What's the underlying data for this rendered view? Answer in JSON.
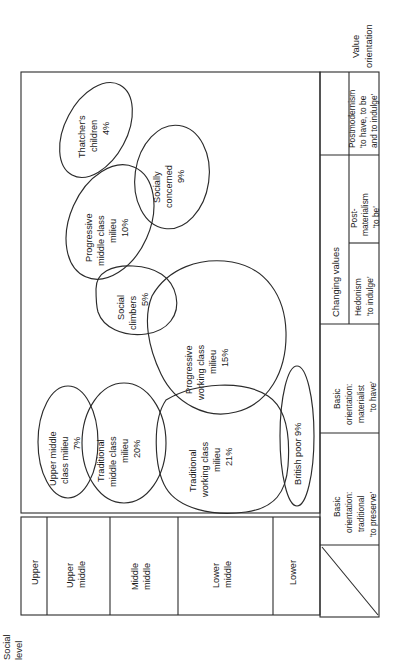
{
  "figure": {
    "axis_labels": {
      "y_axis": "Social level",
      "x_axis": "Value orientation",
      "changing_values_header": "Changing values"
    }
  },
  "social_levels": [
    {
      "id": "upper",
      "label": "Upper"
    },
    {
      "id": "upper-middle",
      "label": "Upper\nmiddle"
    },
    {
      "id": "middle-middle",
      "label": "Middle\nmiddle"
    },
    {
      "id": "lower-middle",
      "label": "Lower\nmiddle"
    },
    {
      "id": "lower",
      "label": "Lower"
    }
  ],
  "value_orientations": [
    {
      "id": "basic-traditional",
      "group": "",
      "line1": "Basic",
      "line2": "orientation:",
      "line3": "traditional",
      "line4": "'to preserve'"
    },
    {
      "id": "basic-materialist",
      "group": "",
      "line1": "Basic",
      "line2": "orientation:",
      "line3": "materialist",
      "line4": "'to have'"
    },
    {
      "id": "hedonism",
      "group": "Changing values",
      "line1": "Hedonism",
      "line2": "'to indulge'",
      "line3": "",
      "line4": ""
    },
    {
      "id": "post-materialism",
      "group": "Changing values",
      "line1": "Post-",
      "line2": "materialism",
      "line3": "'to be'",
      "line4": ""
    },
    {
      "id": "postmodernism",
      "group": "Changing values",
      "line1": "Postmodernism",
      "line2": "'to have, to be",
      "line3": "and to indulge'",
      "line4": ""
    }
  ],
  "milieus": [
    {
      "id": "thatchers-children",
      "name": "Thatcher's\nchildren",
      "share": "4%"
    },
    {
      "id": "progressive-middle-class",
      "name": "Progressive\nmiddle class\nmilieu",
      "share": "10%"
    },
    {
      "id": "socially-concerned",
      "name": "Socially\nconcerned",
      "share": "9%"
    },
    {
      "id": "social-climbers",
      "name": "Social\nclimbers",
      "share": "5%"
    },
    {
      "id": "progressive-working-class",
      "name": "Progressive\nworking class\nmilieu",
      "share": "15%"
    },
    {
      "id": "upper-middle-class",
      "name": "Upper middle\nclass milieu",
      "share": "7%"
    },
    {
      "id": "traditional-middle-class",
      "name": "Traditional\nmiddle class\nmilieu",
      "share": "20%"
    },
    {
      "id": "traditional-working-class",
      "name": "Traditional\nworking class\nmilieu",
      "share": "21%"
    },
    {
      "id": "british-poor",
      "name": "British poor",
      "share": "9%"
    }
  ],
  "milieu_text": {
    "thatchers_children": {
      "l1": "Thatcher's",
      "l2": "children",
      "l3": "4%"
    },
    "progressive_middle": {
      "l1": "Progressive",
      "l2": "middle class",
      "l3": "milieu",
      "l4": "10%"
    },
    "socially_concerned": {
      "l1": "Socially",
      "l2": "concerned",
      "l3": "9%"
    },
    "social_climbers": {
      "l1": "Social",
      "l2": "climbers",
      "l3": "5%"
    },
    "progressive_working": {
      "l1": "Progressive",
      "l2": "working class",
      "l3": "milieu",
      "l4": "15%"
    },
    "upper_middle_class": {
      "l1": "Upper middle",
      "l2": "class milieu",
      "l3": "7%"
    },
    "traditional_middle": {
      "l1": "Traditional",
      "l2": "middle class",
      "l3": "milieu",
      "l4": "20%"
    },
    "traditional_working": {
      "l1": "Traditional",
      "l2": "working class",
      "l3": "milieu",
      "l4": "21%"
    },
    "british_poor": {
      "l1": "British poor 9%"
    }
  },
  "level_text": {
    "upper": {
      "l1": "Upper"
    },
    "upper_middle": {
      "l1": "Upper",
      "l2": "middle"
    },
    "middle_middle": {
      "l1": "Middle",
      "l2": "middle"
    },
    "lower_middle": {
      "l1": "Lower",
      "l2": "middle"
    },
    "lower": {
      "l1": "Lower"
    }
  },
  "value_text": {
    "basic_traditional": {
      "l1": "Basic",
      "l2": "orientation:",
      "l3": "traditional",
      "l4": "'to preserve'"
    },
    "basic_materialist": {
      "l1": "Basic",
      "l2": "orientation:",
      "l3": "materialist",
      "l4": "'to have'"
    },
    "hedonism": {
      "l1": "Hedonism",
      "l2": "'to indulge'"
    },
    "post_materialism": {
      "l1": "Post-",
      "l2": "materialism",
      "l3": "'to be'"
    },
    "postmodernism": {
      "l1": "Postmodernism",
      "l2": "'to have, to be",
      "l3": "and to indulge'"
    },
    "changing_values": {
      "l1": "Changing values"
    }
  },
  "axis_text": {
    "social_level": {
      "l1": "Social",
      "l2": "level"
    },
    "value_orientation": {
      "l1": "Value",
      "l2": "orientation"
    }
  }
}
